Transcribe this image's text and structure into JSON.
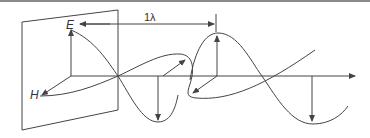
{
  "figure": {
    "type": "electromagnetic-wave-diagram",
    "labels": {
      "electric_field": "E",
      "magnetic_field": "H",
      "wavelength": "1λ"
    },
    "colors": {
      "stroke": "#444444",
      "background": "#ffffff",
      "top_rule": "#8a8a8a"
    }
  }
}
